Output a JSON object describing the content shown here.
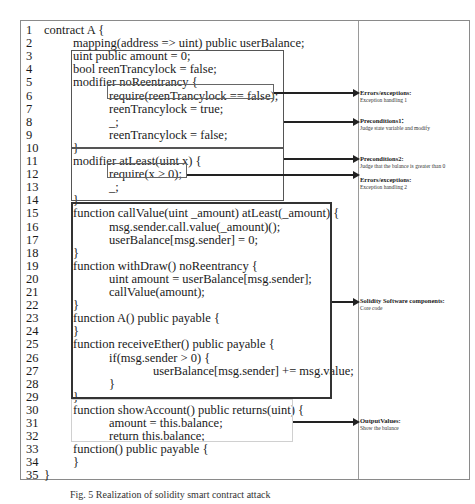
{
  "code_lines": [
    {
      "n": "1",
      "indent": 1,
      "text": "contract A {"
    },
    {
      "n": "2",
      "indent": 2,
      "text": "mapping(address => uint) public userBalance;"
    },
    {
      "n": "3",
      "indent": 2,
      "text": "uint public amount = 0;"
    },
    {
      "n": "4",
      "indent": 2,
      "text": "bool reenTrancylock = false;"
    },
    {
      "n": "5",
      "indent": 2,
      "text": "modifier noReentrancy {"
    },
    {
      "n": "6",
      "indent": 3,
      "text": "require(reenTrancylock == false);"
    },
    {
      "n": "7",
      "indent": 3,
      "text": "reenTrancylock = true;"
    },
    {
      "n": "8",
      "indent": 3,
      "text": "_;"
    },
    {
      "n": "9",
      "indent": 3,
      "text": "reenTrancylock = false;"
    },
    {
      "n": "10",
      "indent": 2,
      "text": "}"
    },
    {
      "n": "11",
      "indent": 2,
      "text": "modifier atLeast(uint x) {"
    },
    {
      "n": "12",
      "indent": 3,
      "text": "require(x > 0);"
    },
    {
      "n": "13",
      "indent": 3,
      "text": "_;"
    },
    {
      "n": "14",
      "indent": 2,
      "text": "}"
    },
    {
      "n": "15",
      "indent": 2,
      "text": "function callValue(uint _amount) atLeast(_amount) {"
    },
    {
      "n": "16",
      "indent": 3,
      "text": "msg.sender.call.value(_amount)();"
    },
    {
      "n": "17",
      "indent": 3,
      "text": "userBalance[msg.sender] = 0;"
    },
    {
      "n": "18",
      "indent": 2,
      "text": "}"
    },
    {
      "n": "19",
      "indent": 2,
      "text": "function withDraw() noReentrancy {"
    },
    {
      "n": "20",
      "indent": 3,
      "text": "uint amount = userBalance[msg.sender];"
    },
    {
      "n": "21",
      "indent": 3,
      "text": "callValue(amount);"
    },
    {
      "n": "22",
      "indent": 2,
      "text": "}"
    },
    {
      "n": "23",
      "indent": 2,
      "text": "function A() public payable {"
    },
    {
      "n": "24",
      "indent": 2,
      "text": "}"
    },
    {
      "n": "25",
      "indent": 2,
      "text": "function receiveEther() public payable {"
    },
    {
      "n": "26",
      "indent": 3,
      "text": "if(msg.sender > 0) {"
    },
    {
      "n": "27",
      "indent": 4,
      "text": "userBalance[msg.sender] += msg.value;"
    },
    {
      "n": "28",
      "indent": 3,
      "text": "}"
    },
    {
      "n": "29",
      "indent": 2,
      "text": "}"
    },
    {
      "n": "30",
      "indent": 2,
      "text": "function showAccount() public returns(uint) {"
    },
    {
      "n": "31",
      "indent": 3,
      "text": "amount = this.balance;"
    },
    {
      "n": "32",
      "indent": 3,
      "text": "return this.balance;"
    },
    {
      "n": "33",
      "indent": 2,
      "text": "function() public payable {"
    },
    {
      "n": "34",
      "indent": 2,
      "text": "}"
    },
    {
      "n": "35",
      "indent": 1,
      "text": "}"
    }
  ],
  "annotations": [
    {
      "title": "Errors/exceptions:",
      "desc": "Exception handling 1"
    },
    {
      "title": "Preconditions1：",
      "desc": "Judge state variable and modify"
    },
    {
      "title": "Preconditions2:",
      "desc": "Judge that the balance is greater than 0"
    },
    {
      "title": "Errors/exceptions:",
      "desc": "Exception handling 2"
    },
    {
      "title": "Solidity Software components:",
      "desc": "Core code"
    },
    {
      "title": "OutputValues:",
      "desc": "Show the balance"
    }
  ],
  "caption": "Fig. 5   Realization of solidity smart contract attack"
}
